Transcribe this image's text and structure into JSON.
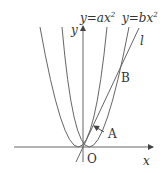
{
  "labels": {
    "curve_a": "y=ax²",
    "curve_a_y": "y",
    "curve_a_eq": "=ax",
    "curve_b_y": "y",
    "curve_b_eq": "=bx",
    "sup": "2",
    "line": "l",
    "y_axis": "y",
    "x_axis": "x",
    "origin": "O",
    "point_a": "A",
    "point_b": "B"
  },
  "colors": {
    "stroke": "#555555",
    "text": "#333333"
  }
}
